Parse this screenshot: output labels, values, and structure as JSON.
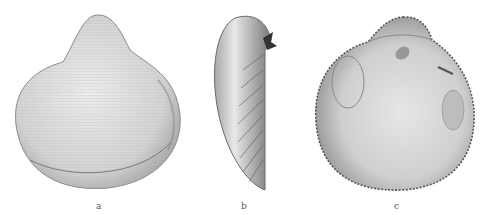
{
  "plate": {
    "figures": [
      {
        "id": "a",
        "label": "a",
        "view": "exterior"
      },
      {
        "id": "b",
        "label": "b",
        "view": "lateral"
      },
      {
        "id": "c",
        "label": "c",
        "view": "interior"
      }
    ]
  },
  "colors": {
    "background": "#ffffff",
    "shell_light": "#e4e4e4",
    "shell_mid": "#bdbdbd",
    "shell_dark": "#555555"
  }
}
